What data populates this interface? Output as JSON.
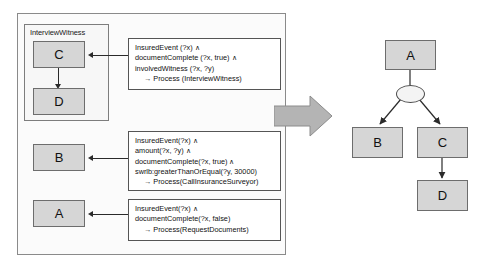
{
  "left_panel": {
    "subprocess": {
      "label": "InterviewWitness",
      "tasks": [
        {
          "name": "C",
          "label": "C"
        },
        {
          "name": "D",
          "label": "D"
        }
      ]
    },
    "tasks": [
      {
        "name": "B",
        "label": "B"
      },
      {
        "name": "A",
        "label": "A"
      }
    ]
  },
  "rules": [
    {
      "id": "rule-interview-witness",
      "lines": [
        "InsuredEvent (?x) ∧",
        "documentComplete (?x, true) ∧",
        "involvedWitness (?x, ?y)"
      ],
      "conclusion": "→  Process (InterviewWitness)"
    },
    {
      "id": "rule-call-insurance-surveyor",
      "lines": [
        "InsuredEvent(?x) ∧",
        "amount(?x, ?y) ∧",
        "documentComplete(?x, true) ∧",
        "swrlb:greaterThanOrEqual(?y, 30000)"
      ],
      "conclusion": "→  Process(CallInsuranceSurveyor)"
    },
    {
      "id": "rule-request-documents",
      "lines": [
        "InsuredEvent(?x) ∧",
        "documentComplete(?x, false)"
      ],
      "conclusion": "→  Process(RequestDocuments)"
    }
  ],
  "transform_arrow": {
    "name": "transformation-arrow",
    "direction": "right"
  },
  "tree": {
    "nodes": [
      {
        "name": "tree-node-a",
        "label": "A"
      },
      {
        "name": "tree-node-b",
        "label": "B"
      },
      {
        "name": "tree-node-c",
        "label": "C"
      },
      {
        "name": "tree-node-d",
        "label": "D"
      }
    ],
    "gateway": {
      "name": "tree-gateway",
      "label": ""
    },
    "edges": [
      "A-gateway",
      "gateway-B",
      "gateway-C",
      "C-D"
    ]
  },
  "colors": {
    "task_fill": "#d6d6d6",
    "task_border": "#6d6d6d",
    "panel_border": "#8a8a8a",
    "rule_border": "#555555",
    "arrow_fill": "#b4b4b4",
    "line": "#2a2a2a"
  }
}
